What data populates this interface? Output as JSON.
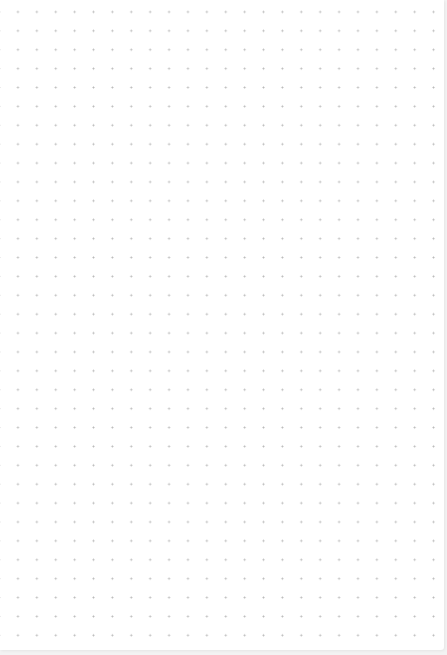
{
  "canvas": {
    "type": "dot-grid",
    "background_color": "#ffffff",
    "dot_color": "#b9b9b9",
    "grid_spacing_px": 19,
    "content": []
  }
}
